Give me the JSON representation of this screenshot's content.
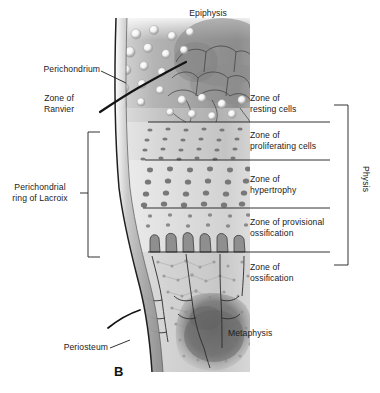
{
  "figure": {
    "panel_label": "B",
    "caption_title": "Structure of the growth plate (physis)",
    "background_color": "#ffffff",
    "ink_color": "#1b1b1b"
  },
  "labels": {
    "epiphysis": "Epiphysis",
    "perichondrium": "Perichondrium",
    "zone_of_ranvier": "Zone of\nRanvier",
    "perichondrial_ring": "Perichondrial\nring of Lacroix",
    "periosteum": "Periosteum",
    "metaphysis": "Metaphysis",
    "physis": "Physis"
  },
  "zones": [
    {
      "id": "resting",
      "name": "Zone of\nresting cells"
    },
    {
      "id": "proliferating",
      "name": "Zone of\nproliferating cells"
    },
    {
      "id": "hypertrophy",
      "name": "Zone of\nhypertrophy"
    },
    {
      "id": "provisional",
      "name": "Zone of provisional\nossification"
    },
    {
      "id": "ossification",
      "name": "Zone of\nossification"
    }
  ]
}
